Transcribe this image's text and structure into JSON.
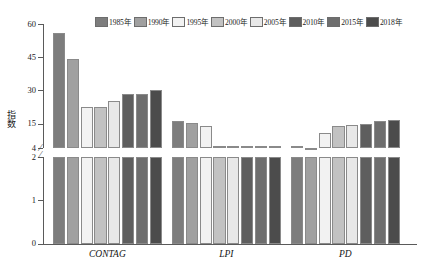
{
  "chart_data": {
    "type": "bar",
    "title": "",
    "subtitle": "",
    "xlabel": "",
    "ylabel": "指数",
    "grid": false,
    "legend_position": "top",
    "broken_axis": true,
    "upper_axis_range": [
      4,
      60
    ],
    "lower_axis_range": [
      0,
      2
    ],
    "upper_ticks": [
      60,
      45,
      30,
      15,
      4
    ],
    "lower_ticks": [
      2,
      1,
      0
    ],
    "categories": [
      "CONTAG",
      "LPI",
      "PD"
    ],
    "series": [
      {
        "name": "1985年",
        "color": "#7d7d7d",
        "values": [
          56.0,
          16.0,
          3.2
        ]
      },
      {
        "name": "1990年",
        "color": "#a0a0a0",
        "values": [
          44.0,
          15.4,
          4.2
        ]
      },
      {
        "name": "1995年",
        "color": "#f2f2f2",
        "values": [
          22.4,
          14.0,
          11.0
        ]
      },
      {
        "name": "2000年",
        "color": "#c2c2c2",
        "values": [
          22.4,
          3.3,
          13.9
        ]
      },
      {
        "name": "2005年",
        "color": "#e8e8e8",
        "values": [
          25.4,
          3.3,
          14.4
        ]
      },
      {
        "name": "2010年",
        "color": "#5e5e5e",
        "values": [
          28.6,
          3.5,
          15.0
        ]
      },
      {
        "name": "2015年",
        "color": "#6e6e6e",
        "values": [
          28.6,
          3.5,
          16.0
        ]
      },
      {
        "name": "2018年",
        "color": "#4c4c4c",
        "values": [
          30.1,
          3.5,
          16.5
        ]
      }
    ]
  },
  "legend": {
    "items": [
      {
        "label": "1985年"
      },
      {
        "label": "1990年"
      },
      {
        "label": "1995年"
      },
      {
        "label": "2000年"
      },
      {
        "label": "2005年"
      },
      {
        "label": "2010年"
      },
      {
        "label": "2015年"
      },
      {
        "label": "2018年"
      }
    ]
  },
  "axis": {
    "y_title": "指数",
    "break_marker": "⁄",
    "y_labels_upper": [
      "60",
      "45",
      "30",
      "15",
      "4"
    ],
    "y_labels_lower": [
      "2",
      "1",
      "0"
    ]
  },
  "groups": [
    {
      "label": "CONTAG"
    },
    {
      "label": "LPI"
    },
    {
      "label": "PD"
    }
  ]
}
